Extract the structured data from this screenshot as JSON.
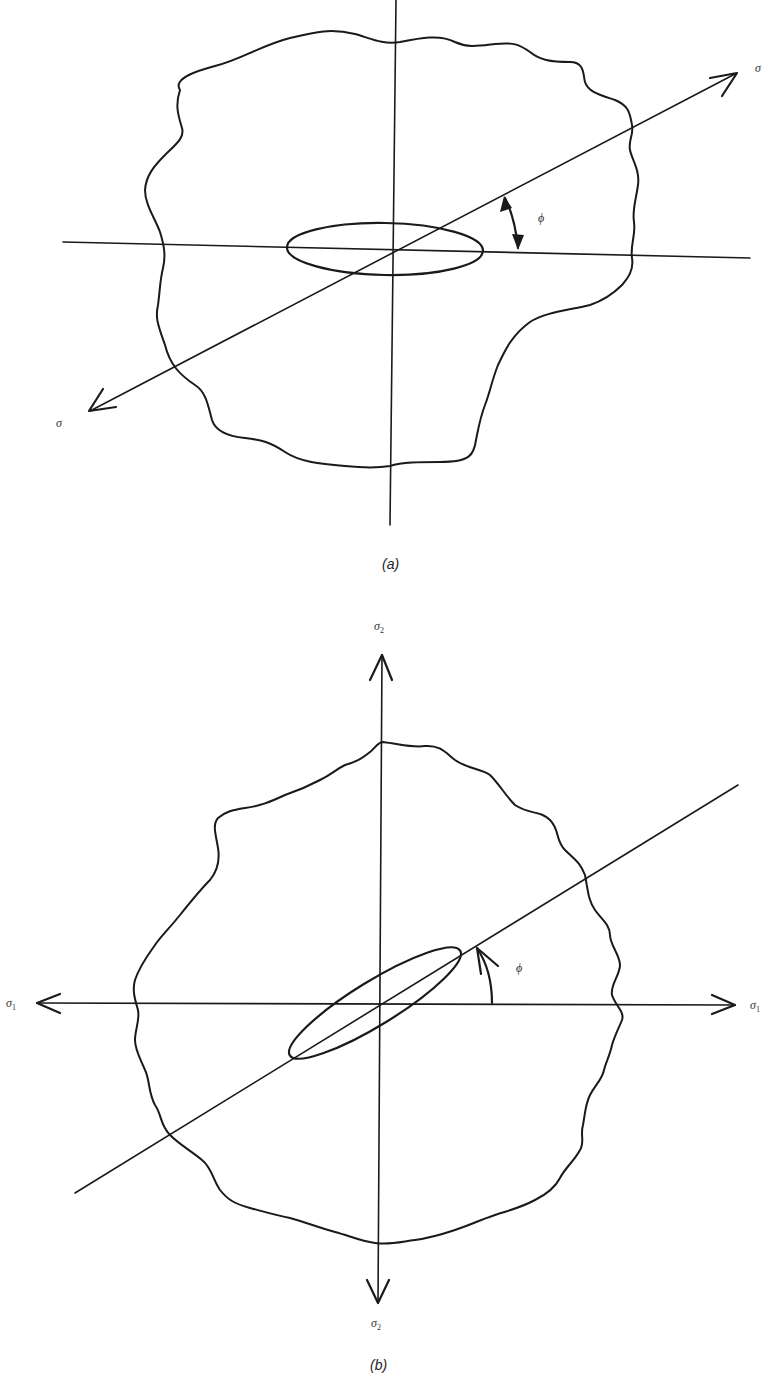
{
  "figures": [
    {
      "id": "a",
      "caption": "(a)",
      "description": "Plate with elliptical crack along horizontal axis under uniaxial stress applied at angle phi",
      "labels": {
        "stress_upper_right": "σ",
        "stress_lower_left": "σ",
        "angle": "ϕ"
      },
      "elements": [
        "irregular plate outline",
        "horizontal axis",
        "vertical axis",
        "inclined loading axis with arrows",
        "horizontal elliptical crack",
        "double-headed angle arrow"
      ]
    },
    {
      "id": "b",
      "caption": "(b)",
      "description": "Plate under biaxial stress sigma1 (horizontal) and sigma2 (vertical) with crack inclined at angle phi",
      "labels": {
        "sigma2_top": "σ",
        "sigma2_top_sub": "2",
        "sigma2_bottom": "σ",
        "sigma2_bottom_sub": "2",
        "sigma1_left": "σ",
        "sigma1_left_sub": "1",
        "sigma1_right": "σ",
        "sigma1_right_sub": "1",
        "angle": "ϕ"
      },
      "elements": [
        "irregular plate outline",
        "horizontal sigma1 axis with arrows both ends",
        "vertical sigma2 axis with arrows both ends",
        "inclined crack axis",
        "inclined elliptical crack",
        "single-headed angle arrow"
      ]
    }
  ]
}
